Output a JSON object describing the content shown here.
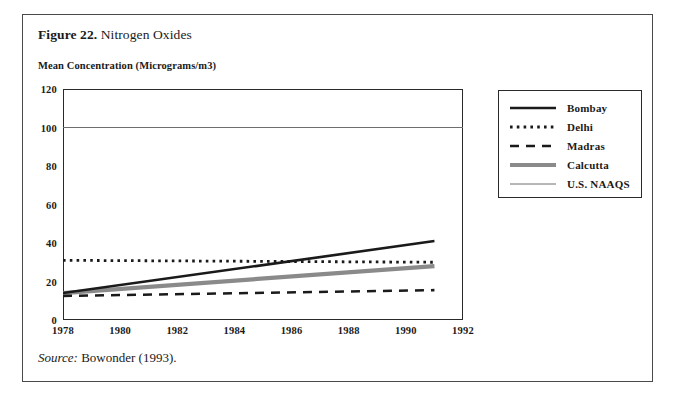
{
  "figure": {
    "caption_number": "Figure 22.",
    "caption_title": " Nitrogen Oxides",
    "source_label": "Source:",
    "source_text": " Bowonder (1993)."
  },
  "chart_data": {
    "type": "line",
    "title": "Nitrogen Oxides",
    "xlabel": "",
    "ylabel": "Mean Concentration (Micrograms/m3)",
    "xlim": [
      1978,
      1992
    ],
    "ylim": [
      0,
      120
    ],
    "xticks": [
      1978,
      1980,
      1982,
      1984,
      1986,
      1988,
      1990,
      1992
    ],
    "yticks": [
      0,
      20,
      40,
      60,
      80,
      100,
      120
    ],
    "grid": false,
    "legend_position": "right",
    "series": [
      {
        "name": "Bombay",
        "style": "solid-thick",
        "color": "#1a1a1a",
        "x": [
          1978,
          1991
        ],
        "values": [
          14,
          41
        ]
      },
      {
        "name": "Delhi",
        "style": "dotted",
        "color": "#1a1a1a",
        "x": [
          1978,
          1991
        ],
        "values": [
          31,
          30
        ]
      },
      {
        "name": "Madras",
        "style": "dashed",
        "color": "#1a1a1a",
        "x": [
          1978,
          1991
        ],
        "values": [
          12.5,
          15.5
        ]
      },
      {
        "name": "Calcutta",
        "style": "solid-thick-gray",
        "color": "#8a8a8a",
        "x": [
          1978,
          1991
        ],
        "values": [
          14,
          28
        ]
      },
      {
        "name": "U.S. NAAQS",
        "style": "solid-thin",
        "color": "#6e6e6e",
        "x": [
          1978,
          1992
        ],
        "values": [
          100,
          100
        ]
      }
    ]
  }
}
